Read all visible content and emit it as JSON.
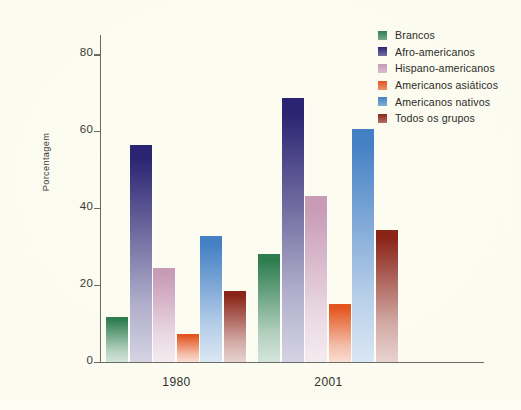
{
  "chart_data": {
    "type": "bar",
    "title": "",
    "xlabel": "",
    "ylabel": "Porcentagem",
    "categories": [
      "1980",
      "2001"
    ],
    "ylim": [
      0,
      85
    ],
    "yticks": [
      0,
      20,
      40,
      60,
      80
    ],
    "ytick_labels": [
      "0",
      "20",
      "40",
      "60",
      "80"
    ],
    "grid": false,
    "legend_position": "right",
    "series": [
      {
        "name": "Brancos",
        "color": "#2e7d4f",
        "values": [
          11.5,
          28.1
        ]
      },
      {
        "name": "Afro-americanos",
        "color": "#2b2472",
        "values": [
          56.3,
          68.6
        ]
      },
      {
        "name": "Hispano-americanos",
        "color": "#c79ab6",
        "values": [
          24.3,
          43.1
        ]
      },
      {
        "name": "Americanos asiáticos",
        "color": "#e3551e",
        "values": [
          7.2,
          15.0
        ]
      },
      {
        "name": "Americanos nativos",
        "color": "#4480c4",
        "values": [
          32.8,
          60.6
        ]
      },
      {
        "name": "Todos os grupos",
        "color": "#8b2418",
        "values": [
          18.3,
          34.3
        ]
      }
    ]
  },
  "legend": {
    "items": [
      {
        "label": "Brancos"
      },
      {
        "label": "Afro-americanos"
      },
      {
        "label": "Hispano-americanos"
      },
      {
        "label": "Americanos asiáticos"
      },
      {
        "label": "Americanos nativos"
      },
      {
        "label": "Todos os grupos"
      }
    ]
  },
  "axes": {
    "y_label": "Porcentagem",
    "y_tick_labels": [
      "0",
      "20",
      "40",
      "60",
      "80"
    ],
    "x_tick_labels": [
      "1980",
      "2001"
    ]
  }
}
